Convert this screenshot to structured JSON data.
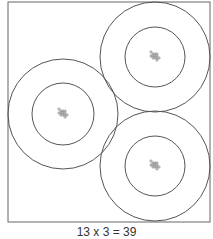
{
  "caption": "13 x 3 = 39",
  "colors": {
    "stroke": "#555555",
    "dot": "#777777",
    "background": "#ffffff"
  },
  "frame": {
    "x": 8,
    "y": 2,
    "width": 202,
    "height": 220
  },
  "groups": [
    {
      "name": "top-right",
      "cx": 155,
      "cy": 57,
      "outer_r": 55,
      "inner_r": 30,
      "dots": 13
    },
    {
      "name": "left",
      "cx": 63,
      "cy": 114,
      "outer_r": 55,
      "inner_r": 31,
      "dots": 13
    },
    {
      "name": "bottom-right",
      "cx": 155,
      "cy": 166,
      "outer_r": 55,
      "inner_r": 30,
      "dots": 13
    }
  ]
}
